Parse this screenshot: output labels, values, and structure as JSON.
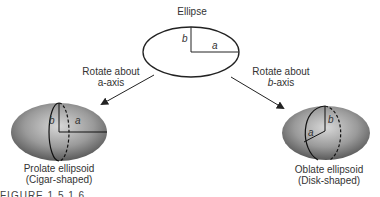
{
  "diagram": {
    "ellipse": {
      "title": "Ellipse",
      "semi_major_label": "a",
      "semi_minor_label": "b"
    },
    "left_arrow": {
      "line1": "Rotate about",
      "line2": "a-axis"
    },
    "right_arrow": {
      "line1": "Rotate about",
      "line2_italic": "b",
      "line2_rest": "-axis"
    },
    "prolate": {
      "name": "Prolate ellipsoid",
      "desc": "(Cigar-shaped)",
      "a_label": "a",
      "b_label": "b"
    },
    "oblate": {
      "name": "Oblate ellipsoid",
      "desc": "(Disk-shaped)",
      "a_label": "a",
      "b_label": "b"
    },
    "caption_fragment": "FIGURE 1.5  1.6"
  }
}
